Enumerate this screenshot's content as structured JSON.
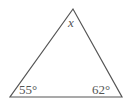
{
  "diagram": {
    "type": "triangle",
    "stroke_color": "#555555",
    "vertices": {
      "apex": [
        73,
        9
      ],
      "bottom_left": [
        10,
        97
      ],
      "bottom_right": [
        122,
        97
      ]
    },
    "labels": {
      "apex": "x",
      "bottom_left": "55°",
      "bottom_right": "62°"
    }
  }
}
